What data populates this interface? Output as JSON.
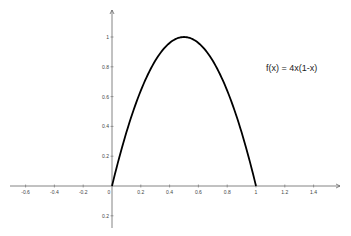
{
  "chart_data": {
    "type": "line",
    "title": "",
    "xlabel": "",
    "ylabel": "",
    "xlim": [
      -0.72,
      1.6
    ],
    "ylim": [
      -0.3,
      1.2
    ],
    "grid": false,
    "x_ticks": [
      -0.6,
      -0.4,
      -0.2,
      0,
      0.2,
      0.4,
      0.6,
      0.8,
      1,
      1.2,
      1.4
    ],
    "x_tick_labels": [
      "-0.6",
      "-0.4",
      "-0.2",
      "0",
      "0.2",
      "0.4",
      "0.6",
      "0.8",
      "1",
      "1.2",
      "1.4"
    ],
    "y_ticks": [
      0.2,
      0.4,
      0.6,
      0.8,
      1,
      -0.2
    ],
    "y_tick_labels": [
      "0.2",
      "0.4",
      "0.6",
      "0.8",
      "1",
      "0.2"
    ],
    "series": [
      {
        "name": "f(x) = 4x(1-x)",
        "expression": "4x(1-x)",
        "x": [
          0,
          0.1,
          0.2,
          0.3,
          0.4,
          0.5,
          0.6,
          0.7,
          0.8,
          0.9,
          1
        ],
        "values": [
          0,
          0.36,
          0.64,
          0.84,
          0.96,
          1,
          0.96,
          0.84,
          0.64,
          0.36,
          0
        ]
      }
    ],
    "annotations": [
      {
        "text": "f(x) = 4x(1-x)",
        "x": 1.12,
        "y": 0.87
      }
    ]
  },
  "colors": {
    "curve": "#000000",
    "axis": "#666666",
    "text": "#444444"
  }
}
